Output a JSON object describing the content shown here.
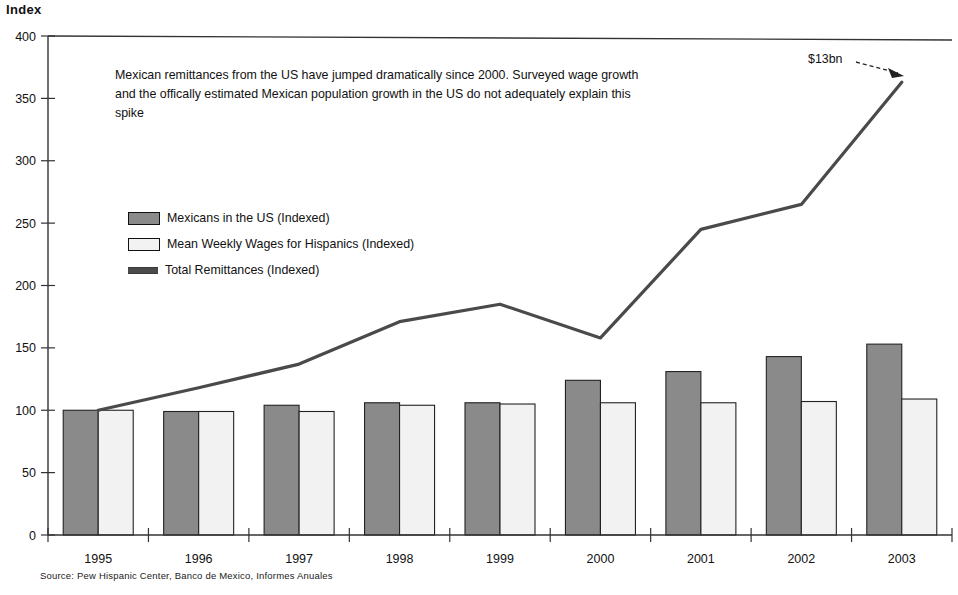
{
  "axis": {
    "y_title": "Index",
    "y_ticks": [
      400,
      350,
      300,
      250,
      200,
      150,
      100,
      50,
      0
    ],
    "y_min": 0,
    "y_max": 400
  },
  "annotation": {
    "line1": "Mexican remittances from the US have jumped dramatically since 2000.  Surveyed wage growth",
    "line2": "and the offically estimated Mexican population growth in the US do not adequately explain this",
    "line3": "spike",
    "callout": "$13bn"
  },
  "legend": {
    "items": [
      {
        "label": "Mexicans in the US (Indexed)",
        "style": "dark",
        "color": "#8a8a8a"
      },
      {
        "label": "Mean Weekly Wages for Hispanics (Indexed)",
        "style": "light",
        "color": "#f2f2f2"
      },
      {
        "label": "Total Remittances (Indexed)",
        "style": "line",
        "color": "#4a4a4a"
      }
    ]
  },
  "source": "Source: Pew Hispanic Center, Banco de Mexico, Informes Anuales",
  "chart_data": {
    "type": "bar",
    "title": "",
    "subtitle": "",
    "xlabel": "",
    "ylabel": "Index",
    "ylim": [
      0,
      400
    ],
    "ytick_step": 50,
    "grid": false,
    "legend_position": "inside-upper-left",
    "categories": [
      "1995",
      "1996",
      "1997",
      "1998",
      "1999",
      "2000",
      "2001",
      "2002",
      "2003"
    ],
    "series": [
      {
        "name": "Mexicans in the US (Indexed)",
        "type": "bar",
        "color": "#8a8a8a",
        "values": [
          100,
          99,
          104,
          106,
          106,
          124,
          131,
          143,
          153
        ]
      },
      {
        "name": "Mean Weekly Wages for Hispanics (Indexed)",
        "type": "bar",
        "color": "#f2f2f2",
        "values": [
          100,
          99,
          99,
          104,
          105,
          106,
          106,
          107,
          109
        ]
      },
      {
        "name": "Total Remittances (Indexed)",
        "type": "line",
        "color": "#4a4a4a",
        "values": [
          100,
          118,
          137,
          171,
          185,
          158,
          245,
          265,
          363
        ]
      }
    ],
    "annotations": [
      {
        "text": "$13bn",
        "target_category": "2003",
        "target_series": "Total Remittances (Indexed)",
        "target_value": 363
      },
      {
        "text": "Mexican remittances from the US have jumped dramatically since 2000.  Surveyed wage growth and the offically estimated Mexican population growth in the US do not adequately explain this spike"
      }
    ]
  }
}
